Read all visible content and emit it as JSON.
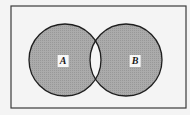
{
  "diagram": {
    "type": "venn",
    "shaded_region": "symmetric difference (A and B excluding intersection)",
    "universe": {
      "x": 11,
      "y": 6,
      "width": 175,
      "height": 102
    },
    "sets": [
      {
        "label": "A",
        "cx": 65,
        "cy": 60,
        "r": 36,
        "label_x": 63,
        "label_y": 61
      },
      {
        "label": "B",
        "cx": 126,
        "cy": 60,
        "r": 36,
        "label_x": 135,
        "label_y": 61
      }
    ],
    "colors": {
      "background": "#f4f4f4",
      "shade": "#a9a9a9",
      "intersection": "#f6f6f6",
      "stroke": "#1e1e1e",
      "frame": "#3a3a3a"
    }
  }
}
